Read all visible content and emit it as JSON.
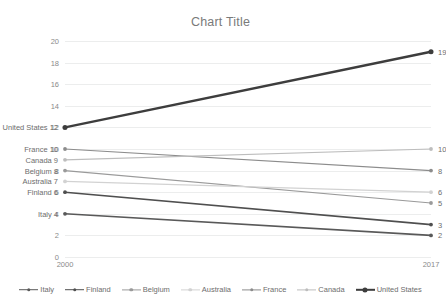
{
  "chart_data": {
    "type": "line",
    "title": "Chart Title",
    "xlabel": "",
    "ylabel": "",
    "x": [
      "2000",
      "2017"
    ],
    "categories": [
      "2000",
      "2017"
    ],
    "ylim": [
      0,
      20
    ],
    "ytick_step": 2,
    "yticks": [
      "0",
      "2",
      "4",
      "6",
      "8",
      "10",
      "12",
      "14",
      "16",
      "18",
      "20"
    ],
    "grid": true,
    "legend_position": "bottom",
    "series": [
      {
        "name": "Italy",
        "values": [
          4,
          2
        ],
        "color": "#595959",
        "width": 1.6,
        "left_label": "Italy 4",
        "right_label": "2"
      },
      {
        "name": "Finland",
        "values": [
          6,
          3
        ],
        "color": "#4f4f4f",
        "width": 1.6,
        "left_label": "Finland 6",
        "right_label": "3"
      },
      {
        "name": "Belgium",
        "values": [
          8,
          5
        ],
        "color": "#9a9a9a",
        "width": 1.2,
        "left_label": "Belgium 8",
        "right_label": "5"
      },
      {
        "name": "Australia",
        "values": [
          7,
          6
        ],
        "color": "#d2d2d2",
        "width": 1.2,
        "left_label": "Australia 7",
        "right_label": "6"
      },
      {
        "name": "France",
        "values": [
          10,
          8
        ],
        "color": "#8c8c8c",
        "width": 1.2,
        "left_label": "France 10",
        "right_label": "8"
      },
      {
        "name": "Canada",
        "values": [
          9,
          10
        ],
        "color": "#bdbdbd",
        "width": 1.2,
        "left_label": "Canada 9",
        "right_label": "10"
      },
      {
        "name": "United States",
        "values": [
          12,
          19
        ],
        "color": "#3d3d3d",
        "width": 2.4,
        "left_label": "United States 12",
        "right_label": "19"
      }
    ]
  },
  "legend": {
    "items": [
      {
        "label": "Italy",
        "color": "#595959",
        "width": 1.6
      },
      {
        "label": "Finland",
        "color": "#4f4f4f",
        "width": 1.6
      },
      {
        "label": "Belgium",
        "color": "#9a9a9a",
        "width": 1.2
      },
      {
        "label": "Australia",
        "color": "#d2d2d2",
        "width": 1.2
      },
      {
        "label": "France",
        "color": "#8c8c8c",
        "width": 1.2
      },
      {
        "label": "Canada",
        "color": "#bdbdbd",
        "width": 1.2
      },
      {
        "label": "United States",
        "color": "#3d3d3d",
        "width": 2.4
      }
    ]
  },
  "style": {
    "gridline_color": "#eceded",
    "tick_text_color": "#8a8a8a",
    "label_text_color": "#6d6d6d",
    "title_color": "#7a7a7a",
    "background": "#ffffff"
  }
}
